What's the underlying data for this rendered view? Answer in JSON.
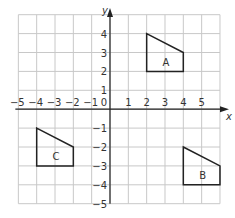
{
  "diagram": {
    "type": "coordinate-grid",
    "axes": {
      "x_label": "x",
      "y_label": "y",
      "x_range": [
        -5,
        6
      ],
      "y_range": [
        -5,
        5
      ],
      "x_ticks": [
        "−5",
        "−4",
        "−3",
        "−2",
        "−1",
        "1",
        "2",
        "3",
        "4",
        "5"
      ],
      "y_ticks": [
        "4",
        "3",
        "2",
        "1",
        "−1",
        "−2",
        "−3",
        "−4",
        "−5"
      ],
      "origin_label": "0"
    },
    "shapes": [
      {
        "label": "A",
        "vertices": [
          [
            2,
            4
          ],
          [
            4,
            3
          ],
          [
            4,
            2
          ],
          [
            2,
            2
          ]
        ]
      },
      {
        "label": "B",
        "vertices": [
          [
            4,
            -2
          ],
          [
            6,
            -3
          ],
          [
            6,
            -4
          ],
          [
            4,
            -4
          ]
        ]
      },
      {
        "label": "C",
        "vertices": [
          [
            -4,
            -1
          ],
          [
            -2,
            -2
          ],
          [
            -2,
            -3
          ],
          [
            -4,
            -3
          ]
        ]
      }
    ],
    "colors": {
      "grid": "#c8c8c8",
      "axis": "#222222",
      "shape": "#222222",
      "text": "#333333"
    }
  }
}
